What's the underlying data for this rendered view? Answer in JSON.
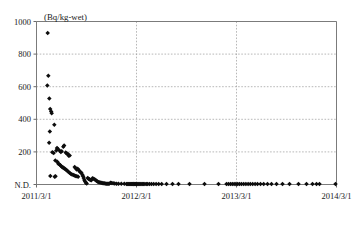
{
  "chart_data": {
    "type": "scatter",
    "title": "",
    "subtitle": "",
    "unit_label": "(Bq/kg-wet)",
    "xlabel": "",
    "ylabel": "",
    "grid": true,
    "legend": null,
    "marker": "filled-diamond",
    "marker_color": "#0d0d0d",
    "ylim": [
      0,
      1000
    ],
    "ytick_labels": [
      "1000",
      "800",
      "600",
      "400",
      "200",
      "N.D."
    ],
    "ytick_values": [
      1000,
      800,
      600,
      400,
      200,
      0
    ],
    "xlim": [
      "2011/3/1",
      "2014/3/1"
    ],
    "xtick_labels": [
      "2011/3/1",
      "2012/3/1",
      "2013/3/1",
      "2014/3/1"
    ],
    "xtick_values": [
      0,
      1,
      2,
      3
    ],
    "note_nd": "N.D. denotes not detected (plotted at axis baseline)",
    "points": [
      {
        "x": 0.112,
        "y": 930
      },
      {
        "x": 0.118,
        "y": 667
      },
      {
        "x": 0.108,
        "y": 608
      },
      {
        "x": 0.128,
        "y": 527
      },
      {
        "x": 0.137,
        "y": 463
      },
      {
        "x": 0.147,
        "y": 448
      },
      {
        "x": 0.152,
        "y": 437
      },
      {
        "x": 0.133,
        "y": 325
      },
      {
        "x": 0.178,
        "y": 367
      },
      {
        "x": 0.126,
        "y": 256
      },
      {
        "x": 0.158,
        "y": 198
      },
      {
        "x": 0.172,
        "y": 193
      },
      {
        "x": 0.198,
        "y": 209
      },
      {
        "x": 0.205,
        "y": 224
      },
      {
        "x": 0.212,
        "y": 220
      },
      {
        "x": 0.232,
        "y": 207
      },
      {
        "x": 0.243,
        "y": 200
      },
      {
        "x": 0.252,
        "y": 204
      },
      {
        "x": 0.268,
        "y": 232
      },
      {
        "x": 0.276,
        "y": 240
      },
      {
        "x": 0.292,
        "y": 196
      },
      {
        "x": 0.302,
        "y": 190
      },
      {
        "x": 0.312,
        "y": 188
      },
      {
        "x": 0.322,
        "y": 176
      },
      {
        "x": 0.332,
        "y": 178
      },
      {
        "x": 0.188,
        "y": 148
      },
      {
        "x": 0.208,
        "y": 139
      },
      {
        "x": 0.218,
        "y": 128
      },
      {
        "x": 0.228,
        "y": 124
      },
      {
        "x": 0.238,
        "y": 118
      },
      {
        "x": 0.248,
        "y": 112
      },
      {
        "x": 0.258,
        "y": 106
      },
      {
        "x": 0.266,
        "y": 104
      },
      {
        "x": 0.275,
        "y": 100
      },
      {
        "x": 0.284,
        "y": 96
      },
      {
        "x": 0.295,
        "y": 90
      },
      {
        "x": 0.305,
        "y": 86
      },
      {
        "x": 0.318,
        "y": 78
      },
      {
        "x": 0.33,
        "y": 72
      },
      {
        "x": 0.342,
        "y": 66
      },
      {
        "x": 0.355,
        "y": 62
      },
      {
        "x": 0.368,
        "y": 58
      },
      {
        "x": 0.38,
        "y": 55
      },
      {
        "x": 0.392,
        "y": 52
      },
      {
        "x": 0.404,
        "y": 50
      },
      {
        "x": 0.416,
        "y": 47
      },
      {
        "x": 0.138,
        "y": 52
      },
      {
        "x": 0.182,
        "y": 48
      },
      {
        "x": 0.19,
        "y": 50
      },
      {
        "x": 0.382,
        "y": 108
      },
      {
        "x": 0.392,
        "y": 100
      },
      {
        "x": 0.402,
        "y": 92
      },
      {
        "x": 0.412,
        "y": 96
      },
      {
        "x": 0.424,
        "y": 88
      },
      {
        "x": 0.432,
        "y": 80
      },
      {
        "x": 0.44,
        "y": 76
      },
      {
        "x": 0.45,
        "y": 70
      },
      {
        "x": 0.458,
        "y": 60
      },
      {
        "x": 0.466,
        "y": 50
      },
      {
        "x": 0.472,
        "y": 40
      },
      {
        "x": 0.478,
        "y": 28
      },
      {
        "x": 0.486,
        "y": 18
      },
      {
        "x": 0.494,
        "y": 10
      },
      {
        "x": 0.502,
        "y": 6
      },
      {
        "x": 0.512,
        "y": 40
      },
      {
        "x": 0.52,
        "y": 36
      },
      {
        "x": 0.528,
        "y": 32
      },
      {
        "x": 0.538,
        "y": 28
      },
      {
        "x": 0.548,
        "y": 26
      },
      {
        "x": 0.56,
        "y": 38
      },
      {
        "x": 0.572,
        "y": 36
      },
      {
        "x": 0.584,
        "y": 30
      },
      {
        "x": 0.596,
        "y": 24
      },
      {
        "x": 0.606,
        "y": 20
      },
      {
        "x": 0.616,
        "y": 16
      },
      {
        "x": 0.626,
        "y": 14
      },
      {
        "x": 0.636,
        "y": 12
      },
      {
        "x": 0.646,
        "y": 10
      },
      {
        "x": 0.656,
        "y": 9
      },
      {
        "x": 0.666,
        "y": 8
      },
      {
        "x": 0.676,
        "y": 7
      },
      {
        "x": 0.686,
        "y": 6
      },
      {
        "x": 0.696,
        "y": 5
      },
      {
        "x": 0.706,
        "y": 5
      },
      {
        "x": 0.716,
        "y": 4
      },
      {
        "x": 0.726,
        "y": 4
      },
      {
        "x": 0.74,
        "y": 10
      },
      {
        "x": 0.752,
        "y": 9
      },
      {
        "x": 0.766,
        "y": 8
      },
      {
        "x": 0.782,
        "y": 6
      },
      {
        "x": 0.8,
        "y": 5
      },
      {
        "x": 0.82,
        "y": 4
      },
      {
        "x": 0.848,
        "y": 4
      },
      {
        "x": 0.878,
        "y": 4
      },
      {
        "x": 0.9,
        "y": 3
      },
      {
        "x": 0.912,
        "y": 3
      },
      {
        "x": 0.922,
        "y": 3
      },
      {
        "x": 0.932,
        "y": 3
      },
      {
        "x": 0.942,
        "y": 3
      },
      {
        "x": 0.95,
        "y": 3
      },
      {
        "x": 0.958,
        "y": 3
      },
      {
        "x": 0.966,
        "y": 3
      },
      {
        "x": 0.974,
        "y": 3
      },
      {
        "x": 0.982,
        "y": 3
      },
      {
        "x": 0.99,
        "y": 3
      },
      {
        "x": 0.998,
        "y": 3
      },
      {
        "x": 1.006,
        "y": 3
      },
      {
        "x": 1.016,
        "y": 3
      },
      {
        "x": 1.026,
        "y": 3
      },
      {
        "x": 1.036,
        "y": 3
      },
      {
        "x": 1.046,
        "y": 3
      },
      {
        "x": 1.058,
        "y": 3
      },
      {
        "x": 1.07,
        "y": 3
      },
      {
        "x": 1.084,
        "y": 3
      },
      {
        "x": 1.098,
        "y": 3
      },
      {
        "x": 1.112,
        "y": 3
      },
      {
        "x": 1.13,
        "y": 3
      },
      {
        "x": 1.15,
        "y": 3
      },
      {
        "x": 1.172,
        "y": 3
      },
      {
        "x": 1.196,
        "y": 3
      },
      {
        "x": 1.222,
        "y": 3
      },
      {
        "x": 1.252,
        "y": 3
      },
      {
        "x": 1.3,
        "y": 3
      },
      {
        "x": 1.36,
        "y": 3
      },
      {
        "x": 1.42,
        "y": 3
      },
      {
        "x": 1.53,
        "y": 3
      },
      {
        "x": 1.68,
        "y": 3
      },
      {
        "x": 1.82,
        "y": 3
      },
      {
        "x": 1.9,
        "y": 3
      },
      {
        "x": 1.92,
        "y": 3
      },
      {
        "x": 1.94,
        "y": 3
      },
      {
        "x": 1.958,
        "y": 3
      },
      {
        "x": 1.976,
        "y": 3
      },
      {
        "x": 1.994,
        "y": 3
      },
      {
        "x": 2.012,
        "y": 3
      },
      {
        "x": 2.03,
        "y": 3
      },
      {
        "x": 2.05,
        "y": 3
      },
      {
        "x": 2.072,
        "y": 3
      },
      {
        "x": 2.094,
        "y": 3
      },
      {
        "x": 2.116,
        "y": 3
      },
      {
        "x": 2.138,
        "y": 3
      },
      {
        "x": 2.162,
        "y": 3
      },
      {
        "x": 2.186,
        "y": 3
      },
      {
        "x": 2.21,
        "y": 3
      },
      {
        "x": 2.24,
        "y": 3
      },
      {
        "x": 2.272,
        "y": 3
      },
      {
        "x": 2.31,
        "y": 3
      },
      {
        "x": 2.35,
        "y": 3
      },
      {
        "x": 2.4,
        "y": 3
      },
      {
        "x": 2.46,
        "y": 3
      },
      {
        "x": 2.53,
        "y": 3
      },
      {
        "x": 2.62,
        "y": 3
      },
      {
        "x": 2.7,
        "y": 3
      },
      {
        "x": 2.76,
        "y": 3
      },
      {
        "x": 2.8,
        "y": 3
      },
      {
        "x": 2.83,
        "y": 3
      },
      {
        "x": 2.99,
        "y": 3
      }
    ]
  }
}
